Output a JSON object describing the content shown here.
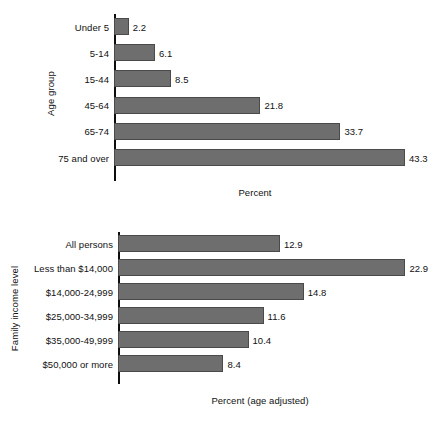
{
  "chart_data": [
    {
      "type": "bar",
      "orientation": "horizontal",
      "title": "",
      "xlabel": "Percent",
      "ylabel": "Age group",
      "categories": [
        "Under 5",
        "5-14",
        "15-44",
        "45-64",
        "65-74",
        "75 and over"
      ],
      "values": [
        2.2,
        6.1,
        8.5,
        21.8,
        33.7,
        43.3
      ],
      "value_labels": [
        "2.2",
        "6.1",
        "8.5",
        "21.8",
        "33.7",
        "43.3"
      ],
      "xlim": [
        0,
        47.5
      ],
      "grid": false,
      "legend": "none",
      "bar_color": "#6e6e6e",
      "bar_border_color": "#4a4a4a",
      "axis_color": "#0d0d0d"
    },
    {
      "type": "bar",
      "orientation": "horizontal",
      "title": "",
      "xlabel": "Percent (age adjusted)",
      "ylabel": "Family income level",
      "categories": [
        "All persons",
        "Less than $14,000",
        "$14,000-24,999",
        "$25,000-34,999",
        "$35,000-49,999",
        "$50,000 or more"
      ],
      "values": [
        12.9,
        22.9,
        14.8,
        11.6,
        10.4,
        8.4
      ],
      "value_labels": [
        "12.9",
        "22.9",
        "14.8",
        "11.6",
        "10.4",
        "8.4"
      ],
      "xlim": [
        0,
        25.1
      ],
      "grid": false,
      "legend": "none",
      "bar_color": "#6e6e6e",
      "bar_border_color": "#4a4a4a",
      "axis_color": "#0d0d0d"
    }
  ]
}
